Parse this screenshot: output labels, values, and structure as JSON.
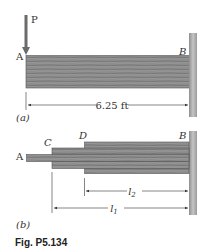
{
  "figure": {
    "caption": "Fig. P5.134",
    "colors": {
      "wood_fill": "#8a8a8a",
      "wood_grain": "#5e5e5e",
      "wall": "#a9a9a9",
      "line": "#333333",
      "arrow": "#6b6b6b"
    },
    "part_a": {
      "tag": "(a)",
      "load_label": "P",
      "point_free_end": "A",
      "point_fixed_end": "B",
      "length_dimension": "6.25 ft"
    },
    "part_b": {
      "tag": "(b)",
      "point_a": "A",
      "point_c": "C",
      "point_d": "D",
      "point_b": "B",
      "dim_l2": "l",
      "dim_l2_sub": "2",
      "dim_l1": "l",
      "dim_l1_sub": "1"
    }
  }
}
